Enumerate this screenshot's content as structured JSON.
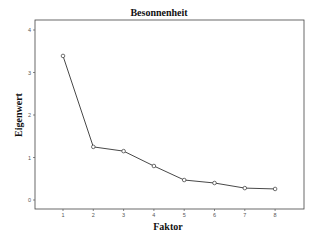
{
  "chart_data": {
    "type": "line",
    "title": "Besonnenheit",
    "xlabel": "Faktor",
    "ylabel": "Eigenwert",
    "categories": [
      "1",
      "2",
      "3",
      "4",
      "5",
      "6",
      "7",
      "8"
    ],
    "x": [
      1,
      2,
      3,
      4,
      5,
      6,
      7,
      8
    ],
    "values": [
      3.39,
      1.25,
      1.15,
      0.8,
      0.47,
      0.4,
      0.28,
      0.26
    ],
    "ylim": [
      -0.2,
      4.2
    ],
    "yticks": [
      0,
      1,
      2,
      3,
      4
    ],
    "xticks": [
      1,
      2,
      3,
      4,
      5,
      6,
      7,
      8
    ],
    "grid": false,
    "legend": null,
    "marker": "open-circle",
    "line_color": "#333333"
  }
}
